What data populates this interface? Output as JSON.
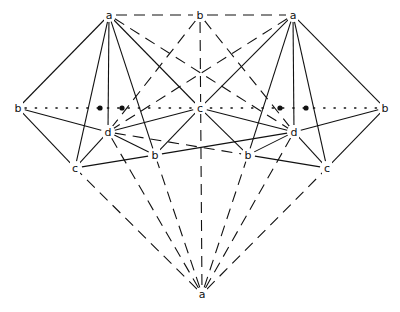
{
  "diagram": {
    "background": "#ffffff",
    "stroke": "#111111",
    "nodes": [
      {
        "id": "a_tl",
        "label": "a",
        "x": 109,
        "y": 15
      },
      {
        "id": "b_top",
        "label": "b",
        "x": 200,
        "y": 15
      },
      {
        "id": "a_tr",
        "label": "a",
        "x": 293,
        "y": 15
      },
      {
        "id": "b_left",
        "label": "b",
        "x": 18,
        "y": 108
      },
      {
        "id": "c_mid",
        "label": "c",
        "x": 200,
        "y": 108
      },
      {
        "id": "b_right",
        "label": "b",
        "x": 385,
        "y": 108
      },
      {
        "id": "d_left",
        "label": "d",
        "x": 108,
        "y": 132
      },
      {
        "id": "d_right",
        "label": "d",
        "x": 294,
        "y": 132
      },
      {
        "id": "b_lc",
        "label": "b",
        "x": 155,
        "y": 155
      },
      {
        "id": "b_rc",
        "label": "b",
        "x": 248,
        "y": 155
      },
      {
        "id": "c_left",
        "label": "c",
        "x": 75,
        "y": 168
      },
      {
        "id": "c_right",
        "label": "c",
        "x": 327,
        "y": 168
      },
      {
        "id": "a_bot",
        "label": "a",
        "x": 202,
        "y": 294
      }
    ],
    "dots": [
      {
        "x": 100,
        "y": 108
      },
      {
        "x": 122,
        "y": 108
      },
      {
        "x": 280,
        "y": 108
      },
      {
        "x": 306,
        "y": 108
      }
    ],
    "edges": [
      {
        "from": "a_tl",
        "to": "b_left",
        "style": "solid"
      },
      {
        "from": "a_tl",
        "to": "c_left",
        "style": "solid"
      },
      {
        "from": "a_tl",
        "to": "d_left",
        "style": "solid"
      },
      {
        "from": "a_tl",
        "to": "b_lc",
        "style": "solid"
      },
      {
        "from": "a_tl",
        "to": "c_mid",
        "style": "solid"
      },
      {
        "from": "a_tr",
        "to": "b_right",
        "style": "solid"
      },
      {
        "from": "a_tr",
        "to": "c_right",
        "style": "solid"
      },
      {
        "from": "a_tr",
        "to": "d_right",
        "style": "solid"
      },
      {
        "from": "a_tr",
        "to": "b_rc",
        "style": "solid"
      },
      {
        "from": "a_tr",
        "to": "c_mid",
        "style": "solid"
      },
      {
        "from": "b_left",
        "to": "d_left",
        "style": "solid"
      },
      {
        "from": "b_left",
        "to": "c_left",
        "style": "solid"
      },
      {
        "from": "b_right",
        "to": "d_right",
        "style": "solid"
      },
      {
        "from": "b_right",
        "to": "c_right",
        "style": "solid"
      },
      {
        "from": "c_mid",
        "to": "d_left",
        "style": "solid"
      },
      {
        "from": "c_mid",
        "to": "d_right",
        "style": "solid"
      },
      {
        "from": "c_mid",
        "to": "b_lc",
        "style": "solid"
      },
      {
        "from": "c_mid",
        "to": "b_rc",
        "style": "solid"
      },
      {
        "from": "d_left",
        "to": "c_left",
        "style": "solid"
      },
      {
        "from": "d_left",
        "to": "b_lc",
        "style": "solid"
      },
      {
        "from": "d_right",
        "to": "c_right",
        "style": "solid"
      },
      {
        "from": "d_right",
        "to": "b_rc",
        "style": "solid"
      },
      {
        "from": "c_left",
        "to": "b_lc",
        "style": "solid"
      },
      {
        "from": "c_right",
        "to": "b_rc",
        "style": "solid"
      },
      {
        "from": "d_right",
        "to": "b_lc",
        "style": "solid"
      },
      {
        "from": "d_left",
        "to": "b_rc",
        "style": "dashed"
      },
      {
        "from": "a_tl",
        "to": "b_top",
        "style": "dashed"
      },
      {
        "from": "b_top",
        "to": "a_tr",
        "style": "dashed"
      },
      {
        "from": "a_tl",
        "to": "d_right",
        "style": "dashed"
      },
      {
        "from": "a_tr",
        "to": "d_left",
        "style": "dashed"
      },
      {
        "from": "b_top",
        "to": "d_left",
        "style": "dashed"
      },
      {
        "from": "b_top",
        "to": "d_right",
        "style": "dashed"
      },
      {
        "from": "b_top",
        "to": "a_bot",
        "style": "dashed"
      },
      {
        "from": "a_bot",
        "to": "c_left",
        "style": "dashed"
      },
      {
        "from": "a_bot",
        "to": "b_lc",
        "style": "dashed"
      },
      {
        "from": "a_bot",
        "to": "d_left",
        "style": "dashed"
      },
      {
        "from": "a_bot",
        "to": "c_right",
        "style": "dashed"
      },
      {
        "from": "a_bot",
        "to": "b_rc",
        "style": "dashed"
      },
      {
        "from": "a_bot",
        "to": "d_right",
        "style": "dashed"
      },
      {
        "from": "b_left",
        "to": "b_right",
        "style": "dotted"
      }
    ]
  }
}
